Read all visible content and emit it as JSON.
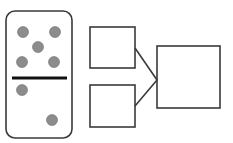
{
  "diagram": {
    "domino": {
      "top_dots": 5,
      "bottom_dots": 2,
      "dot_color": "#8c8c8c",
      "border_color": "#3a3a3a",
      "divider_color": "#111111"
    },
    "boxes": [
      {
        "id": "part-top",
        "value": ""
      },
      {
        "id": "part-bottom",
        "value": ""
      },
      {
        "id": "whole",
        "value": ""
      }
    ]
  }
}
